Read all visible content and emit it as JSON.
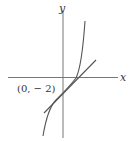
{
  "diagram": {
    "axes": {
      "x_label": "x",
      "y_label": "y"
    },
    "point_label": "(0, − 2)",
    "elements": [
      {
        "type": "curve",
        "description": "increasing cubic-like curve crossing x-axis right of origin"
      },
      {
        "type": "tangent-line",
        "description": "straight line tangent to the curve, passing near (0,-2)"
      }
    ],
    "colors": {
      "stroke": "#555555",
      "axis": "#777777",
      "text": "#333333"
    }
  }
}
